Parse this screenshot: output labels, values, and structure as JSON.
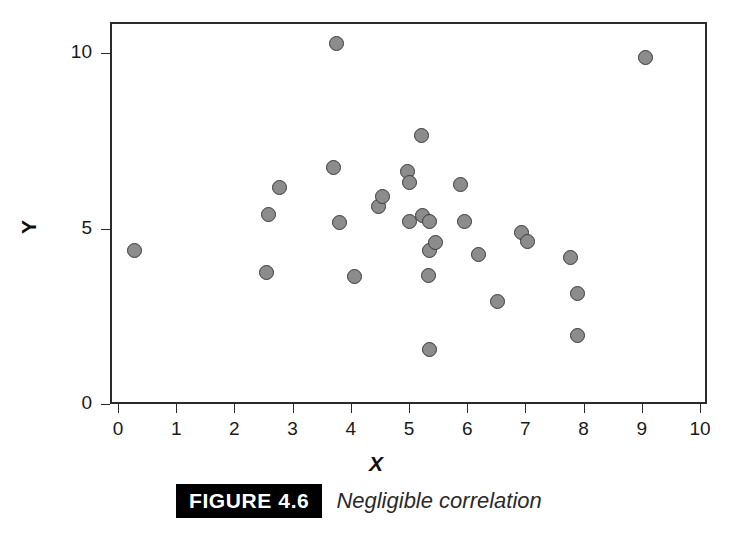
{
  "chart_data": {
    "type": "scatter",
    "title": "",
    "xlabel": "X",
    "ylabel": "Y",
    "xlim": [
      0,
      10
    ],
    "ylim": [
      0,
      10.8
    ],
    "xticks": [
      0,
      1,
      2,
      3,
      4,
      5,
      6,
      7,
      8,
      9,
      10
    ],
    "yticks": [
      0,
      5,
      10
    ],
    "xticklabels": [
      "0",
      "1",
      "2",
      "3",
      "4",
      "5",
      "6",
      "7",
      "8",
      "9",
      "10"
    ],
    "yticklabels": [
      "0",
      "5",
      "10"
    ],
    "grid": false,
    "legend": null,
    "marker": {
      "shape": "circle",
      "fill_color": "#8c8c8c",
      "edge_color": "#3a3a3a",
      "size_px": 15
    },
    "n_points": 31,
    "points": [
      {
        "x": 0.29,
        "y": 4.36
      },
      {
        "x": 2.56,
        "y": 3.76
      },
      {
        "x": 2.58,
        "y": 5.41
      },
      {
        "x": 2.78,
        "y": 6.18
      },
      {
        "x": 3.71,
        "y": 6.75
      },
      {
        "x": 3.75,
        "y": 10.26
      },
      {
        "x": 3.81,
        "y": 5.16
      },
      {
        "x": 4.07,
        "y": 3.62
      },
      {
        "x": 4.48,
        "y": 5.64
      },
      {
        "x": 4.54,
        "y": 5.9
      },
      {
        "x": 4.97,
        "y": 6.61
      },
      {
        "x": 5.0,
        "y": 6.32
      },
      {
        "x": 5.0,
        "y": 5.19
      },
      {
        "x": 5.22,
        "y": 7.66
      },
      {
        "x": 5.24,
        "y": 5.36
      },
      {
        "x": 5.36,
        "y": 5.19
      },
      {
        "x": 5.36,
        "y": 4.36
      },
      {
        "x": 5.36,
        "y": 1.54
      },
      {
        "x": 5.33,
        "y": 3.65
      },
      {
        "x": 5.45,
        "y": 4.59
      },
      {
        "x": 5.88,
        "y": 6.24
      },
      {
        "x": 5.95,
        "y": 5.21
      },
      {
        "x": 6.19,
        "y": 4.25
      },
      {
        "x": 6.52,
        "y": 2.92
      },
      {
        "x": 6.94,
        "y": 4.9
      },
      {
        "x": 7.04,
        "y": 4.62
      },
      {
        "x": 7.77,
        "y": 4.16
      },
      {
        "x": 7.9,
        "y": 3.16
      },
      {
        "x": 7.9,
        "y": 1.94
      },
      {
        "x": 9.07,
        "y": 9.86
      }
    ]
  },
  "caption": {
    "figure_tag": "FIGURE 4.6",
    "text": "Negligible correlation"
  },
  "colors": {
    "axis": "#2b2b2b",
    "marker_fill": "#8c8c8c",
    "marker_edge": "#3a3a3a",
    "tag_background": "#000000",
    "tag_text": "#ffffff",
    "background": "#ffffff"
  }
}
